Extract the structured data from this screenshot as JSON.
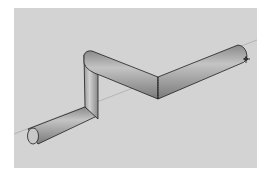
{
  "viewport": {
    "label": "3D model viewport",
    "background": "#d3d3d3",
    "model": "bent pipe",
    "cursor": "orbit-cursor"
  },
  "colors": {
    "pipe_light": "#b8b8b8",
    "pipe_dark": "#7c7c7c",
    "edge": "#1e1e1e",
    "axis": "#9a9a9a"
  }
}
